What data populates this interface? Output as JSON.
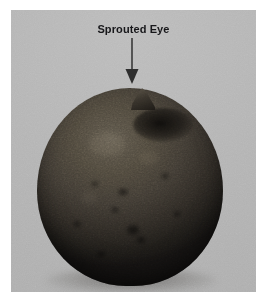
{
  "figure": {
    "kind": "photograph",
    "background_color": "#b4b4b4",
    "page_color": "#ffffff",
    "plate": {
      "left": 11,
      "top": 10,
      "width": 245,
      "height": 282
    }
  },
  "annotation": {
    "label": "Sprouted Eye",
    "label_color": "#17171a",
    "arrow": {
      "name": "down-arrow",
      "color": "#3a3a3a",
      "direction": "down",
      "points_to": "sprout"
    }
  },
  "subject": {
    "name": "potato",
    "skin_color": "#3c3730",
    "shadow_color": "#141211",
    "features": [
      {
        "name": "sprout",
        "label": "sprouted eye"
      },
      {
        "name": "eye-cluster",
        "label": "dark eye cluster"
      }
    ]
  }
}
